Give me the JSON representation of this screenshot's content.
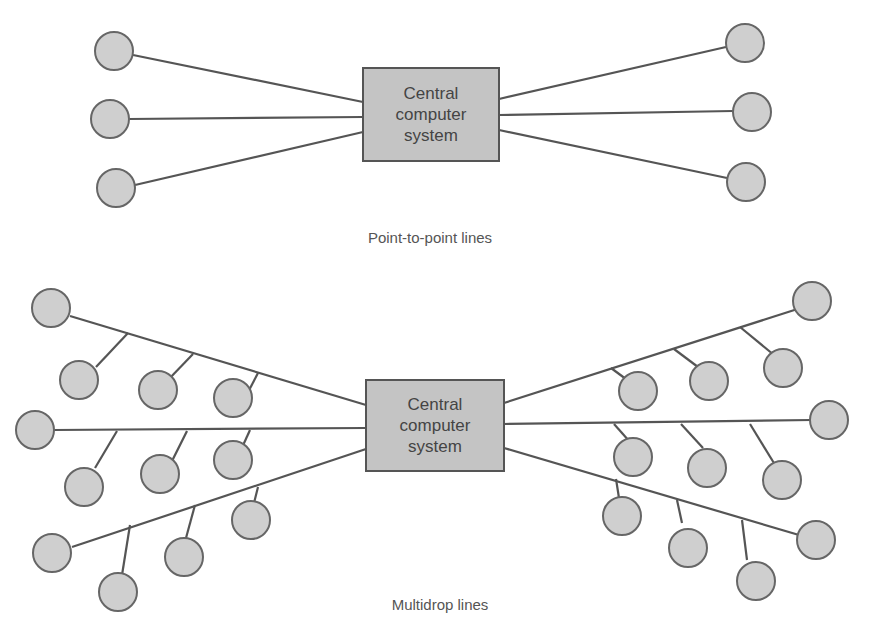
{
  "diagram": {
    "colors": {
      "line": "#555555",
      "node_fill": "#cfcfcf",
      "node_stroke": "#666666",
      "box_fill": "#c4c4c4",
      "text": "#444444"
    },
    "point_to_point": {
      "caption": "Point-to-point lines",
      "caption_pos": [
        430,
        243
      ],
      "central": {
        "x": 363,
        "y": 68,
        "w": 136,
        "h": 93,
        "lines": [
          "Central",
          "computer",
          "system"
        ]
      },
      "nodes": [
        {
          "cx": 114,
          "cy": 51
        },
        {
          "cx": 110,
          "cy": 119
        },
        {
          "cx": 116,
          "cy": 188
        },
        {
          "cx": 745,
          "cy": 43
        },
        {
          "cx": 752,
          "cy": 112
        },
        {
          "cx": 746,
          "cy": 182
        }
      ],
      "links": [
        [
          133,
          55,
          363,
          102
        ],
        [
          129,
          119,
          363,
          117
        ],
        [
          135,
          185,
          363,
          132
        ],
        [
          726,
          47,
          499,
          99
        ],
        [
          733,
          111,
          499,
          115
        ],
        [
          727,
          178,
          499,
          130
        ]
      ]
    },
    "multidrop": {
      "caption": "Multidrop lines",
      "caption_pos": [
        440,
        610
      ],
      "central": {
        "x": 366,
        "y": 380,
        "w": 138,
        "h": 91,
        "lines": [
          "Central",
          "computer",
          "system"
        ]
      },
      "trunks": [
        [
          70,
          316,
          366,
          405
        ],
        [
          54,
          430,
          366,
          428
        ],
        [
          72,
          547,
          366,
          449
        ],
        [
          810,
          305,
          504,
          403
        ],
        [
          812,
          420,
          504,
          424
        ],
        [
          816,
          540,
          504,
          448
        ]
      ],
      "drops": [
        [
          128,
          333,
          96,
          367
        ],
        [
          193,
          354,
          168,
          380
        ],
        [
          258,
          373,
          245,
          398
        ],
        [
          117,
          431,
          95,
          468
        ],
        [
          187,
          431,
          169,
          467
        ],
        [
          250,
          430,
          240,
          452
        ],
        [
          130,
          525,
          122,
          575
        ],
        [
          195,
          505,
          186,
          538
        ],
        [
          258,
          487,
          254,
          503
        ],
        [
          611,
          368,
          634,
          385
        ],
        [
          674,
          349,
          702,
          370
        ],
        [
          740,
          327,
          774,
          355
        ],
        [
          614,
          424,
          630,
          442
        ],
        [
          681,
          424,
          703,
          448
        ],
        [
          750,
          424,
          777,
          468
        ],
        [
          616,
          479,
          619,
          498
        ],
        [
          677,
          500,
          682,
          523
        ],
        [
          742,
          520,
          747,
          560
        ]
      ],
      "nodes": [
        {
          "cx": 51,
          "cy": 308
        },
        {
          "cx": 79,
          "cy": 380
        },
        {
          "cx": 158,
          "cy": 390
        },
        {
          "cx": 233,
          "cy": 398
        },
        {
          "cx": 35,
          "cy": 430
        },
        {
          "cx": 84,
          "cy": 487
        },
        {
          "cx": 160,
          "cy": 474
        },
        {
          "cx": 233,
          "cy": 460
        },
        {
          "cx": 52,
          "cy": 553
        },
        {
          "cx": 118,
          "cy": 592
        },
        {
          "cx": 184,
          "cy": 557
        },
        {
          "cx": 251,
          "cy": 520
        },
        {
          "cx": 812,
          "cy": 301
        },
        {
          "cx": 783,
          "cy": 368
        },
        {
          "cx": 709,
          "cy": 381
        },
        {
          "cx": 638,
          "cy": 391
        },
        {
          "cx": 829,
          "cy": 420
        },
        {
          "cx": 633,
          "cy": 457
        },
        {
          "cx": 707,
          "cy": 468
        },
        {
          "cx": 782,
          "cy": 480
        },
        {
          "cx": 622,
          "cy": 516
        },
        {
          "cx": 688,
          "cy": 548
        },
        {
          "cx": 756,
          "cy": 581
        },
        {
          "cx": 816,
          "cy": 540
        }
      ]
    }
  }
}
